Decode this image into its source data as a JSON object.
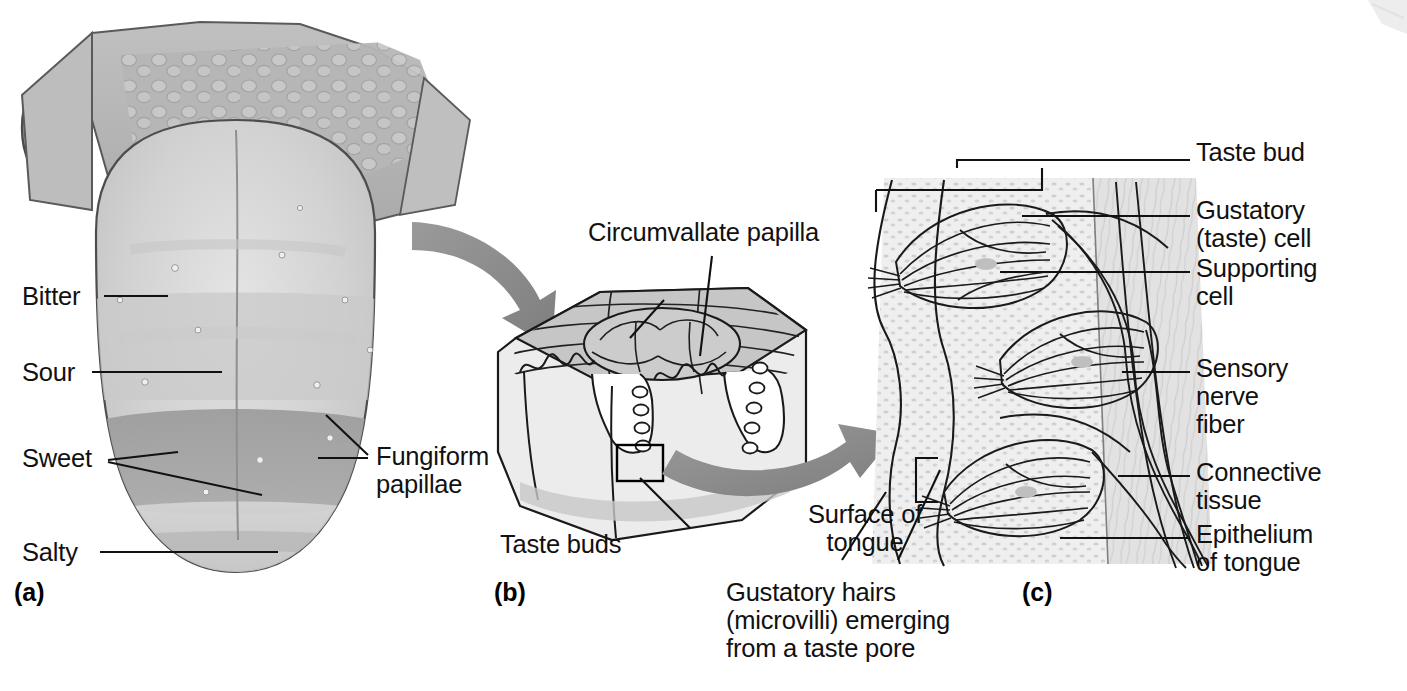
{
  "figure": {
    "background_color": "#ffffff",
    "ink_color": "#111111",
    "arrow_color": "#8a8a8a"
  },
  "panels": [
    {
      "id": "a",
      "id_label": "(a)",
      "caption": "Superior surface of the tongue showing taste regions",
      "labels": [
        {
          "name": "bitter",
          "text": "Bitter"
        },
        {
          "name": "sour",
          "text": "Sour"
        },
        {
          "name": "sweet",
          "text": "Sweet"
        },
        {
          "name": "salty",
          "text": "Salty"
        },
        {
          "name": "fungiform-papillae",
          "text": "Fungiform\npapillae"
        }
      ]
    },
    {
      "id": "b",
      "id_label": "(b)",
      "caption": "Sectional view of a circumvallate papilla",
      "labels": [
        {
          "name": "circumvallate-papilla",
          "text": "Circumvallate papilla"
        },
        {
          "name": "taste-buds",
          "text": "Taste buds"
        }
      ]
    },
    {
      "id": "c",
      "id_label": "(c)",
      "caption": "Enlarged view of taste buds in the epithelium",
      "labels": [
        {
          "name": "taste-bud",
          "text": "Taste bud"
        },
        {
          "name": "gustatory-cell",
          "text": "Gustatory\n(taste) cell"
        },
        {
          "name": "supporting-cell",
          "text": "Supporting\ncell"
        },
        {
          "name": "sensory-nerve-fiber",
          "text": "Sensory\nnerve\nfiber"
        },
        {
          "name": "connective-tissue",
          "text": "Connective\ntissue"
        },
        {
          "name": "epithelium-of-tongue",
          "text": "Epithelium\nof tongue"
        },
        {
          "name": "surface-of-tongue",
          "text": "Surface of\ntongue"
        },
        {
          "name": "gustatory-hairs",
          "text": "Gustatory hairs\n(microvilli) emerging\nfrom a taste pore"
        }
      ]
    }
  ],
  "taste_regions": [
    {
      "name": "bitter",
      "label": "Bitter",
      "position": "posterior (root)"
    },
    {
      "name": "sour",
      "label": "Sour",
      "position": "lateral-posterior"
    },
    {
      "name": "sweet",
      "label": "Sweet",
      "position": "anterior-lateral band"
    },
    {
      "name": "salty",
      "label": "Salty",
      "position": "tip / apex"
    }
  ],
  "shading": {
    "tongue_root": "#b2b2b2",
    "tongue_body_light": "#d8d8d8",
    "tongue_body_mid": "#c2c2c2",
    "sweet_band": "#a0a0a0",
    "block_top": "#c4c4c4",
    "block_side": "#e6e6e6",
    "epithelium": "#ededed",
    "connective": "#dcdcdc"
  }
}
